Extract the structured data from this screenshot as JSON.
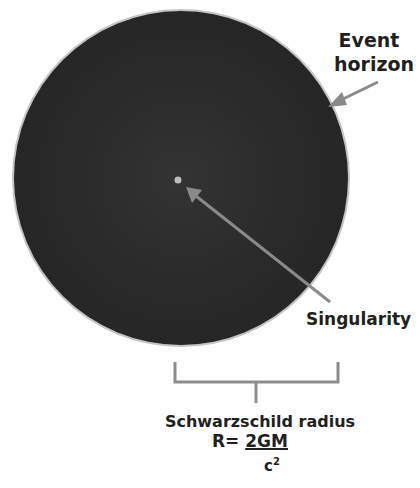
{
  "labels": {
    "event_horizon_line1": "Event",
    "event_horizon_line2": "horizon",
    "singularity": "Singularity",
    "schwarzschild": "Schwarzschild radius"
  },
  "formula": {
    "lhs": "R",
    "equals": "=",
    "numerator": "2GM",
    "denominator_base": "c",
    "denominator_exp": "2"
  },
  "colors": {
    "black_hole": "#2b2b2b",
    "rim": "#bdbdbd",
    "arrow": "#8a8a8a",
    "text": "#231f20",
    "bracket": "#8c8c8c"
  }
}
